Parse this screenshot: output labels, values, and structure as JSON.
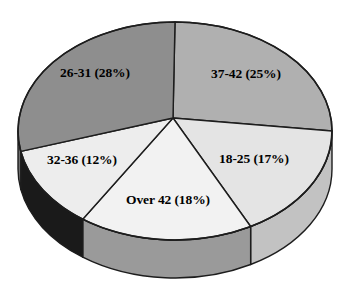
{
  "chart_data": {
    "type": "pie",
    "title": "",
    "subtitle": "",
    "xlabel": "",
    "ylabel": "",
    "legend_position": "none",
    "grid": false,
    "three_d": true,
    "value_unit": "percent",
    "categories": [
      "37-42",
      "18-25",
      "Over 42",
      "32-36",
      "26-31"
    ],
    "values": [
      25,
      17,
      18,
      12,
      28
    ],
    "labels": [
      "37-42 (25%)",
      "18-25 (17%)",
      "Over 42 (18%)",
      "32-36 (12%)",
      "26-31 (28%)"
    ],
    "slices": [
      {
        "name": "37-42",
        "percent": 25,
        "label": "37-42 (25%)",
        "color": "#b0b0b0",
        "side_color": "#8f8f8f",
        "start_angle": 0,
        "end_angle": 90,
        "label_x": 246,
        "label_y": 74
      },
      {
        "name": "18-25",
        "percent": 17,
        "label": "18-25 (17%)",
        "color": "#e4e4e4",
        "side_color": "#c2c2c2",
        "start_angle": 90,
        "end_angle": 151.2,
        "label_x": 254,
        "label_y": 159
      },
      {
        "name": "Over 42",
        "percent": 18,
        "label": "Over 42 (18%)",
        "color": "#f2f2f2",
        "side_color": "#9a9a9a",
        "start_angle": 151.2,
        "end_angle": 216,
        "label_x": 168,
        "label_y": 200
      },
      {
        "name": "32-36",
        "percent": 12,
        "label": "32-36 (12%)",
        "color": "#ededed",
        "side_color": "#1a1a1a",
        "start_angle": 216,
        "end_angle": 259.2,
        "label_x": 82,
        "label_y": 160
      },
      {
        "name": "26-31",
        "percent": 28,
        "label": "26-31 (28%)",
        "color": "#8e8e8e",
        "side_color": "#6e6e6e",
        "start_angle": 259.2,
        "end_angle": 360,
        "label_x": 95,
        "label_y": 73
      }
    ],
    "geometry": {
      "center_x": 175,
      "center_y": 131,
      "apex_x": 173,
      "apex_y": 118,
      "radius_x": 157,
      "radius_y": 109,
      "depth": 38
    },
    "colors": {
      "outline": "#1d1d1d",
      "background": "#ffffff",
      "label_text": "#000000"
    }
  }
}
